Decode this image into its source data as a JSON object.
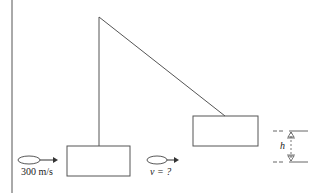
{
  "diagram": {
    "colors": {
      "stroke": "#555555",
      "text": "#222222",
      "background": "#ffffff"
    },
    "pendulum": {
      "pivot": "top",
      "initial_block": "hanging block (lower left)",
      "final_block": "raised block (right)"
    },
    "incoming_bullet": {
      "icon": "bullet-ellipse-arrow-icon",
      "speed_label": "300 m/s"
    },
    "outgoing_bullet": {
      "icon": "bullet-ellipse-arrow-icon",
      "speed_label": "v = ?"
    },
    "height_marker": {
      "label": "h",
      "icon": "height-arrows-icon"
    }
  }
}
